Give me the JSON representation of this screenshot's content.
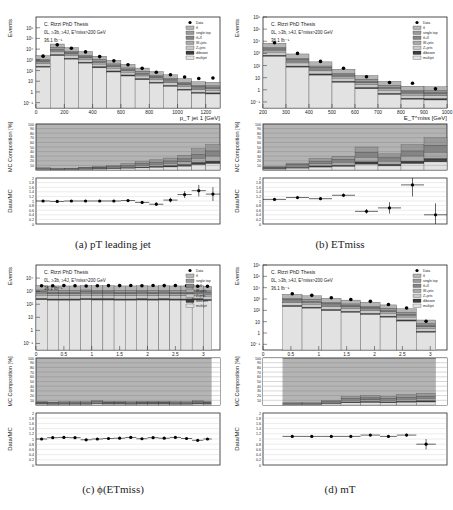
{
  "figure": {
    "legend": {
      "entries": [
        "Data",
        "tt̄",
        "single top",
        "tt̄+X",
        "W+jets",
        "Z+jets",
        "diboson",
        "multijet"
      ],
      "colors": [
        "#000000",
        "#b4b4b4",
        "#9a9a9a",
        "#858585",
        "#a8a8a8",
        "#c8c8c8",
        "#3c3c3c",
        "#e2e2e2"
      ]
    },
    "annotation": {
      "line1": "C. Rizzi PhD Thesis",
      "line2": "0L, ≥3b, ≥4J, Eᵀmiss>200 GeV",
      "line3": "36.1 fb⁻¹"
    },
    "ylabels": {
      "main": "Events",
      "comp": "MC Composition [%]",
      "ratio": "Data/MC"
    }
  },
  "captions": {
    "a": "(a) pT leading jet",
    "b": "(b) ETmiss",
    "c": "(c) ϕ(ETmiss)",
    "d": "(d) mT"
  },
  "chart_data": [
    {
      "id": "a",
      "type": "bar",
      "title": "pT leading jet",
      "xlabel": "p_T jet 1 [GeV]",
      "ylabel": "Events",
      "xlim": [
        0,
        1300
      ],
      "xticks": [
        0,
        200,
        400,
        600,
        800,
        1000,
        1200
      ],
      "ylim_log": [
        -1.5,
        7
      ],
      "yticks": [
        "10⁻¹",
        "1",
        "10",
        "10²",
        "10³",
        "10⁴",
        "10⁵",
        "10⁶"
      ],
      "bin_edges": [
        0,
        100,
        200,
        300,
        400,
        500,
        600,
        700,
        800,
        900,
        1000,
        1100,
        1200,
        1300
      ],
      "total_mc": [
        2500,
        30000,
        14000,
        6000,
        2200,
        900,
        380,
        170,
        80,
        40,
        18,
        9,
        8
      ],
      "data": [
        2200,
        25000,
        12000,
        5500,
        2000,
        800,
        350,
        160,
        70,
        40,
        25,
        18,
        20
      ],
      "comp_bottom_pct": [
        5,
        3,
        4,
        6,
        8,
        10,
        14,
        18,
        22,
        26,
        32,
        46,
        55
      ],
      "ratio": [
        1.0,
        0.98,
        1.0,
        1.0,
        1.0,
        1.0,
        1.02,
        0.94,
        0.86,
        1.04,
        1.28,
        1.45,
        1.3
      ],
      "ratio_err": [
        0.02,
        0.02,
        0.02,
        0.02,
        0.02,
        0.03,
        0.04,
        0.06,
        0.08,
        0.1,
        0.15,
        0.25,
        0.3
      ],
      "ratio_ylim": [
        0,
        2
      ]
    },
    {
      "id": "b",
      "type": "bar",
      "title": "ETmiss",
      "xlabel": "E_T^miss [GeV]",
      "ylabel": "Events",
      "xlim": [
        200,
        1000
      ],
      "xticks": [
        200,
        300,
        400,
        500,
        600,
        700,
        800,
        900,
        1000
      ],
      "ylim_log": [
        -1.5,
        6
      ],
      "yticks": [
        "10⁻¹",
        "1",
        "10",
        "10²",
        "10³",
        "10⁴",
        "10⁵",
        "10⁶"
      ],
      "bin_edges": [
        200,
        300,
        400,
        500,
        600,
        700,
        800,
        900,
        1000
      ],
      "total_mc": [
        7000,
        900,
        200,
        50,
        15,
        5,
        2,
        1.8
      ],
      "data": [
        7500,
        1000,
        220,
        60,
        12,
        4,
        3.5,
        1.2
      ],
      "comp_bottom_pct": [
        8,
        15,
        25,
        30,
        50,
        35,
        55,
        70
      ],
      "ratio": [
        1.07,
        1.15,
        1.1,
        1.25,
        0.55,
        0.7,
        1.7,
        0.4
      ],
      "ratio_err": [
        0.02,
        0.04,
        0.06,
        0.08,
        0.1,
        0.25,
        0.5,
        0.5
      ],
      "ratio_ylim": [
        0,
        2
      ]
    },
    {
      "id": "c",
      "type": "bar",
      "title": "phi(ETmiss)",
      "xlabel": "ϕ_{E_T^miss}",
      "ylabel": "Events",
      "xlim": [
        0,
        3.3
      ],
      "xticks": [
        0,
        0.5,
        1,
        1.5,
        2,
        2.5,
        3
      ],
      "ylim_log": [
        -1.5,
        5
      ],
      "yticks": [
        "10⁻¹",
        "1",
        "10",
        "10²",
        "10³",
        "10⁴"
      ],
      "bin_edges": [
        0,
        0.2,
        0.4,
        0.6,
        0.8,
        1.0,
        1.2,
        1.4,
        1.6,
        1.8,
        2.0,
        2.2,
        2.4,
        2.6,
        2.8,
        3.0,
        3.15
      ],
      "total_mc": [
        2700,
        2500,
        2500,
        2500,
        2700,
        2600,
        2600,
        2500,
        2500,
        2600,
        2500,
        2600,
        2500,
        2500,
        2600,
        2300
      ],
      "data": [
        2600,
        2600,
        2700,
        2600,
        2500,
        2600,
        2650,
        2650,
        2700,
        2600,
        2700,
        2650,
        2700,
        2600,
        2400,
        2400
      ],
      "comp_bottom_pct": [
        8,
        6,
        7,
        7,
        7,
        10,
        8,
        8,
        7,
        8,
        8,
        8,
        7,
        7,
        9,
        8
      ],
      "ratio": [
        1.0,
        1.05,
        1.06,
        1.05,
        0.97,
        1.0,
        1.02,
        1.03,
        1.06,
        1.01,
        1.05,
        1.03,
        1.06,
        1.02,
        0.95,
        1.0
      ],
      "ratio_err": [
        0.02,
        0.02,
        0.02,
        0.02,
        0.02,
        0.02,
        0.02,
        0.02,
        0.02,
        0.02,
        0.02,
        0.02,
        0.02,
        0.02,
        0.02,
        0.02
      ],
      "ratio_ylim": [
        0,
        2
      ]
    },
    {
      "id": "d",
      "type": "bar",
      "title": "mT",
      "xlabel": "Δϕ_{jj}^{min}(j,MET)",
      "ylabel": "Events",
      "xlim": [
        0,
        3.3
      ],
      "xticks": [
        0,
        0.5,
        1,
        1.5,
        2,
        2.5,
        3
      ],
      "ylim_log": [
        -1.5,
        6
      ],
      "yticks": [
        "10⁻¹",
        "1",
        "10",
        "10²",
        "10³",
        "10⁴",
        "10⁵",
        "10⁶"
      ],
      "bin_edges": [
        0.35,
        0.7,
        1.05,
        1.4,
        1.75,
        2.1,
        2.4,
        2.75,
        3.1
      ],
      "total_mc": [
        2600,
        1900,
        1150,
        800,
        520,
        300,
        140,
        14
      ],
      "data": [
        2900,
        2100,
        1300,
        900,
        620,
        330,
        160,
        11
      ],
      "comp_bottom_pct": [
        5,
        5,
        10,
        18,
        20,
        18,
        22,
        25
      ],
      "ratio": [
        1.1,
        1.1,
        1.1,
        1.1,
        1.15,
        1.1,
        1.15,
        0.8
      ],
      "ratio_err": [
        0.02,
        0.03,
        0.03,
        0.03,
        0.04,
        0.05,
        0.06,
        0.2
      ],
      "ratio_ylim": [
        0,
        2
      ]
    }
  ]
}
